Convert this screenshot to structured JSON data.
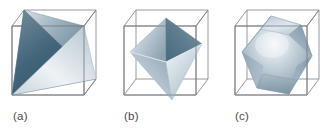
{
  "figure": {
    "background_color": "#ffffff",
    "width": 335,
    "height": 132,
    "panel_count": 3
  },
  "style": {
    "cube_edge_color": "#8c8f96",
    "cube_edge_color_dark": "#6b6f77",
    "solid_light": "#f2f5f8",
    "solid_mid": "#a9bac6",
    "solid_dark": "#3f6070",
    "solid_deep": "#2f5464",
    "solid_shadow": "#7f95a4",
    "label_color": "#4a4a4a"
  },
  "panels": [
    {
      "id": "panel-a",
      "label": "(a)",
      "solid_name": "tetrahedron",
      "description": "Tetrahedron inscribed in a cube",
      "cube_label": "cube-wireframe",
      "faces": 4,
      "vertices": 4,
      "edges": 6
    },
    {
      "id": "panel-b",
      "label": "(b)",
      "solid_name": "octahedron",
      "description": "Octahedron inscribed in a cube",
      "cube_label": "cube-wireframe",
      "faces": 8,
      "vertices": 6,
      "edges": 12
    },
    {
      "id": "panel-c",
      "label": "(c)",
      "solid_name": "cuboctahedron",
      "description": "Cuboctahedron inscribed in a cube",
      "cube_label": "cube-wireframe",
      "faces": 14,
      "vertices": 12,
      "edges": 24
    }
  ]
}
